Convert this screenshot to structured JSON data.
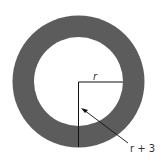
{
  "diagram": {
    "outer_circle": {
      "cx": 78.5,
      "cy": 81.5,
      "r": 66,
      "fill": "#5c5c5c"
    },
    "inner_circle": {
      "cx": 78.5,
      "cy": 81.5,
      "r": 44.5,
      "fill": "#ffffff"
    },
    "labels": {
      "inner_radius": "r",
      "outer_radius": "r + 3"
    },
    "line_color": "#111111"
  }
}
